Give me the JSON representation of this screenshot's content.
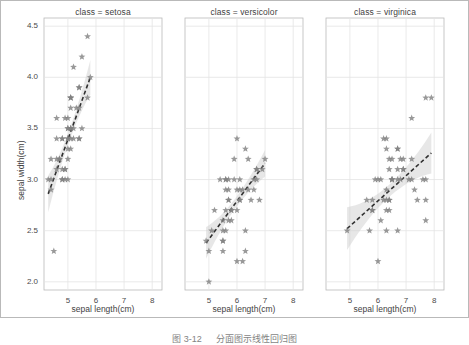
{
  "figure": {
    "background": "#ffffff",
    "marker_color": "#808080",
    "line_color": "#303030",
    "band_color": "#c9c9c9",
    "grid_color": "#e3e3e3",
    "border_color": "#b9b9b9"
  },
  "axes": {
    "ylabel": "sepal width(cm)",
    "xlabel": "sepal length(cm)",
    "yticks": [
      "4.5",
      "4.0",
      "3.5",
      "3.0",
      "2.5",
      "2.0"
    ],
    "ytick_values": [
      4.5,
      4.0,
      3.5,
      3.0,
      2.5,
      2.0
    ],
    "xticks": [
      "5",
      "6",
      "7",
      "8"
    ],
    "xtick_values": [
      5,
      6,
      7,
      8
    ],
    "xlim": [
      4.15,
      8.35
    ],
    "ylim": [
      1.92,
      4.58
    ],
    "grid": true
  },
  "caption": {
    "number": "图 3-12",
    "text": "分面图示线性回归图"
  },
  "chart_data": {
    "type": "scatter",
    "title": "",
    "xlabel": "sepal length(cm)",
    "ylabel": "sepal width(cm)",
    "xlim": [
      4.15,
      8.35
    ],
    "ylim": [
      1.92,
      4.58
    ],
    "grid": true,
    "legend": "none",
    "facet_variable": "class",
    "marker": "star",
    "regression": {
      "style": "dashed",
      "confidence_interval": true
    },
    "panels": [
      {
        "label": "class = setosa",
        "facet_value": "setosa",
        "fit": {
          "x0": 4.3,
          "y0": 2.86,
          "x1": 5.8,
          "y1": 4.0
        },
        "ci": {
          "at_x0": 0.18,
          "at_mid": 0.055,
          "at_x1": 0.17
        },
        "x": [
          5.1,
          4.9,
          4.7,
          4.6,
          5.0,
          5.4,
          4.6,
          5.0,
          4.4,
          4.9,
          5.4,
          4.8,
          4.8,
          4.3,
          5.8,
          5.7,
          5.4,
          5.1,
          5.7,
          5.1,
          5.4,
          5.1,
          4.6,
          5.1,
          4.8,
          5.0,
          5.0,
          5.2,
          5.2,
          4.7,
          4.8,
          5.4,
          5.2,
          5.5,
          4.9,
          5.0,
          5.5,
          4.9,
          4.4,
          5.1,
          5.0,
          4.5,
          4.4,
          5.0,
          5.1,
          4.8,
          5.1,
          4.6,
          5.3,
          5.0
        ],
        "y": [
          3.5,
          3.0,
          3.2,
          3.1,
          3.6,
          3.9,
          3.4,
          3.4,
          2.9,
          3.1,
          3.7,
          3.4,
          3.0,
          3.0,
          4.0,
          4.4,
          3.9,
          3.5,
          3.8,
          3.8,
          3.4,
          3.7,
          3.6,
          3.3,
          3.4,
          3.0,
          3.4,
          3.5,
          3.4,
          3.2,
          3.1,
          3.4,
          4.1,
          4.2,
          3.1,
          3.2,
          3.5,
          3.6,
          3.0,
          3.4,
          3.5,
          2.3,
          3.2,
          3.5,
          3.8,
          3.0,
          3.8,
          3.2,
          3.7,
          3.3
        ]
      },
      {
        "label": "class = versicolor",
        "facet_value": "versicolor",
        "fit": {
          "x0": 4.9,
          "y0": 2.38,
          "x1": 7.0,
          "y1": 3.16
        },
        "ci": {
          "at_x0": 0.155,
          "at_mid": 0.05,
          "at_x1": 0.13
        },
        "x": [
          7.0,
          6.4,
          6.9,
          5.5,
          6.5,
          5.7,
          6.3,
          4.9,
          6.6,
          5.2,
          5.0,
          5.9,
          6.0,
          6.1,
          5.6,
          6.7,
          5.6,
          5.8,
          6.2,
          5.6,
          5.9,
          6.1,
          6.3,
          6.1,
          6.4,
          6.6,
          6.8,
          6.7,
          6.0,
          5.7,
          5.5,
          5.5,
          5.8,
          6.0,
          5.4,
          6.0,
          6.7,
          6.3,
          5.6,
          5.5,
          5.5,
          6.1,
          5.8,
          5.0,
          5.6,
          5.7,
          5.7,
          6.2,
          5.1,
          5.7
        ],
        "y": [
          3.2,
          3.2,
          3.1,
          2.3,
          2.8,
          2.8,
          3.3,
          2.4,
          2.9,
          2.7,
          2.0,
          3.0,
          2.2,
          2.9,
          2.9,
          3.1,
          3.0,
          2.7,
          2.2,
          2.5,
          3.2,
          2.8,
          2.5,
          2.8,
          2.9,
          3.0,
          2.8,
          3.0,
          2.9,
          2.6,
          2.4,
          2.4,
          2.7,
          2.7,
          3.0,
          3.4,
          3.1,
          2.3,
          3.0,
          2.5,
          2.6,
          3.0,
          2.6,
          2.3,
          2.7,
          3.0,
          2.9,
          2.9,
          2.5,
          2.8
        ]
      },
      {
        "label": "class = virginica",
        "facet_value": "virginica",
        "fit": {
          "x0": 4.9,
          "y0": 2.52,
          "x1": 7.9,
          "y1": 3.26
        },
        "ci": {
          "at_x0": 0.21,
          "at_mid": 0.06,
          "at_x1": 0.2
        },
        "x": [
          6.3,
          5.8,
          7.1,
          6.3,
          6.5,
          7.6,
          4.9,
          7.3,
          6.7,
          7.2,
          6.5,
          6.4,
          6.8,
          5.7,
          5.8,
          6.4,
          6.5,
          7.7,
          7.7,
          6.0,
          6.9,
          5.6,
          7.7,
          6.3,
          6.7,
          7.2,
          6.2,
          6.1,
          6.4,
          7.2,
          7.4,
          7.9,
          6.4,
          6.3,
          6.1,
          7.7,
          6.3,
          6.4,
          6.0,
          6.9,
          6.7,
          6.9,
          5.8,
          6.8,
          6.7,
          6.7,
          6.3,
          6.5,
          6.2,
          5.9
        ],
        "y": [
          3.3,
          2.7,
          3.0,
          2.9,
          3.0,
          3.0,
          2.5,
          2.9,
          2.5,
          3.6,
          3.2,
          2.7,
          3.0,
          2.5,
          2.8,
          3.2,
          3.0,
          3.8,
          2.6,
          2.2,
          3.2,
          2.8,
          2.8,
          2.7,
          3.3,
          3.2,
          2.8,
          3.0,
          2.8,
          3.0,
          2.8,
          3.8,
          2.8,
          2.8,
          2.6,
          3.0,
          3.4,
          3.1,
          3.0,
          3.1,
          3.1,
          3.1,
          2.7,
          3.2,
          3.3,
          3.0,
          2.5,
          3.0,
          3.4,
          3.0
        ]
      }
    ]
  }
}
